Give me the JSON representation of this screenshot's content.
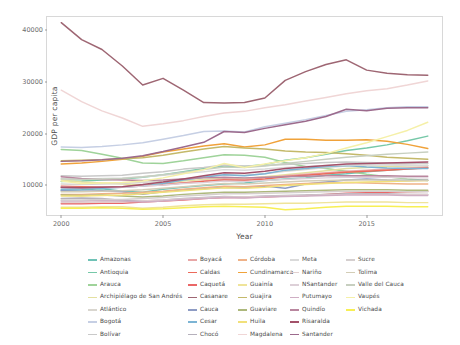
{
  "chart_data": {
    "type": "line",
    "title": "",
    "xlabel": "Year",
    "ylabel": "GDP per capita",
    "xlim": [
      1999.3,
      2018.7
    ],
    "ylim": [
      4200,
      42600
    ],
    "xticks": [
      2000,
      2005,
      2010,
      2015
    ],
    "yticks": [
      10000,
      20000,
      30000,
      40000
    ],
    "ytick_labels": [
      "10000",
      "20000",
      "30000",
      "40000"
    ],
    "xtick_labels": [
      "2000",
      "2005",
      "2010",
      "2015"
    ],
    "grid": false,
    "legend_position": "bottom",
    "legend_columns": 5,
    "x": [
      2000,
      2001,
      2002,
      2003,
      2004,
      2005,
      2006,
      2007,
      2008,
      2009,
      2010,
      2011,
      2012,
      2013,
      2014,
      2015,
      2016,
      2017,
      2018
    ],
    "series": [
      {
        "name": "Amazonas",
        "color": "#6fc2b6",
        "values": [
          9000,
          9100,
          9300,
          8800,
          8600,
          9200,
          9600,
          9900,
          10200,
          10400,
          10900,
          11200,
          11400,
          11900,
          12200,
          12600,
          12900,
          13100,
          13400
        ]
      },
      {
        "name": "Antioquia",
        "color": "#76c8a8",
        "values": [
          10700,
          10800,
          11000,
          11200,
          11500,
          12000,
          12600,
          13200,
          13700,
          13600,
          14000,
          14800,
          15300,
          16000,
          16700,
          17200,
          17800,
          18600,
          19500
        ]
      },
      {
        "name": "Arauca",
        "color": "#9fd39a",
        "values": [
          16900,
          16700,
          16000,
          15200,
          14300,
          14200,
          14700,
          15300,
          15900,
          15800,
          15400,
          14400,
          13600,
          13200,
          12700,
          12100,
          11600,
          11200,
          10900
        ]
      },
      {
        "name": "Archipiélago de San Andrés",
        "color": "#e4e0a0",
        "values": [
          11000,
          10600,
          10400,
          10200,
          10000,
          10300,
          10800,
          11100,
          11400,
          11300,
          11600,
          12000,
          12400,
          12800,
          13200,
          13400,
          13600,
          13700,
          13800
        ]
      },
      {
        "name": "Atlántico",
        "color": "#d9d6cf",
        "values": [
          10200,
          10100,
          10200,
          10300,
          10500,
          10800,
          11200,
          11600,
          12000,
          11900,
          12200,
          12700,
          13000,
          13400,
          13700,
          13900,
          14000,
          14100,
          14300
        ]
      },
      {
        "name": "Bogotá",
        "color": "#c6cfe4",
        "values": [
          17400,
          17300,
          17500,
          17800,
          18200,
          18900,
          19600,
          20400,
          20500,
          20300,
          21300,
          22000,
          22700,
          23500,
          24300,
          24600,
          25000,
          25200,
          25200
        ]
      },
      {
        "name": "Bolívar",
        "color": "#c9c9c9",
        "values": [
          11800,
          11700,
          11800,
          11900,
          12300,
          12600,
          13100,
          13400,
          13900,
          13700,
          13800,
          14000,
          14200,
          14400,
          14500,
          14400,
          14300,
          14200,
          14200
        ]
      },
      {
        "name": "Boyacá",
        "color": "#e8a7a7",
        "values": [
          9500,
          9400,
          9500,
          9600,
          9800,
          10000,
          10400,
          10800,
          11200,
          11100,
          11400,
          11800,
          12100,
          12400,
          12700,
          12900,
          13100,
          13300,
          13500
        ]
      },
      {
        "name": "Caldas",
        "color": "#ec6a5a",
        "values": [
          9800,
          9700,
          9700,
          9700,
          9900,
          10100,
          10400,
          10700,
          11000,
          10900,
          11200,
          11600,
          11900,
          12200,
          12500,
          12700,
          12900,
          13100,
          13300
        ]
      },
      {
        "name": "Caquetá",
        "color": "#ea6767",
        "values": [
          6400,
          6400,
          6500,
          6500,
          6700,
          6900,
          7100,
          7400,
          7600,
          7600,
          7700,
          7900,
          8000,
          8200,
          8400,
          8500,
          8600,
          8700,
          8800
        ]
      },
      {
        "name": "Casanare",
        "color": "#9e6673",
        "values": [
          41500,
          38200,
          36300,
          33100,
          29400,
          30700,
          28400,
          26000,
          25900,
          26000,
          26900,
          30300,
          32000,
          33400,
          34300,
          32300,
          31700,
          31400,
          31300
        ]
      },
      {
        "name": "Cauca",
        "color": "#8e9cc4",
        "values": [
          8900,
          8800,
          8900,
          8700,
          8200,
          8700,
          9100,
          9300,
          9600,
          9500,
          9800,
          9400,
          10200,
          10600,
          11000,
          11200,
          11000,
          10900,
          11000
        ]
      },
      {
        "name": "Cesar",
        "color": "#7cb4d4",
        "values": [
          9200,
          9300,
          9400,
          9600,
          9800,
          10300,
          11000,
          11500,
          12000,
          11800,
          12200,
          12900,
          13200,
          13600,
          13800,
          13500,
          13300,
          13200,
          13200
        ]
      },
      {
        "name": "Chocó",
        "color": "#b5b0bb",
        "values": [
          7400,
          7500,
          7400,
          7000,
          6900,
          7100,
          7400,
          7600,
          7800,
          7700,
          7900,
          8000,
          8100,
          8200,
          8300,
          8300,
          8300,
          8200,
          8200
        ]
      },
      {
        "name": "Córdoba",
        "color": "#efb288",
        "values": [
          8200,
          8200,
          8300,
          8400,
          8600,
          8800,
          9200,
          9500,
          9800,
          9700,
          9900,
          10100,
          10300,
          10400,
          10500,
          10400,
          10300,
          10200,
          10200
        ]
      },
      {
        "name": "Cundinamarca",
        "color": "#f0a23a",
        "values": [
          14100,
          14300,
          14600,
          15000,
          15600,
          16400,
          17000,
          17600,
          18000,
          17400,
          17800,
          18900,
          18900,
          18700,
          18700,
          18800,
          18500,
          17900,
          17100
        ]
      },
      {
        "name": "Guainía",
        "color": "#efe49a",
        "values": [
          5700,
          5700,
          5800,
          5800,
          5500,
          5700,
          6000,
          6200,
          6300,
          6300,
          6400,
          6500,
          6500,
          6600,
          6700,
          6700,
          6700,
          6600,
          6600
        ]
      },
      {
        "name": "Guajira",
        "color": "#c4b96a",
        "values": [
          14700,
          14800,
          14900,
          15100,
          15300,
          15800,
          16400,
          17000,
          17500,
          17200,
          17000,
          16600,
          16400,
          16300,
          16100,
          15800,
          15400,
          15200,
          15000
        ]
      },
      {
        "name": "Guaviare",
        "color": "#adb87c",
        "values": [
          8100,
          8000,
          8100,
          7900,
          7700,
          7900,
          8200,
          8400,
          8600,
          8600,
          8700,
          8800,
          8900,
          9000,
          9100,
          9100,
          9100,
          9000,
          9000
        ]
      },
      {
        "name": "Huila",
        "color": "#f1e07a",
        "values": [
          7900,
          7900,
          8000,
          8100,
          8300,
          8600,
          8900,
          9200,
          9500,
          9400,
          9600,
          9900,
          10100,
          10300,
          10500,
          10600,
          10700,
          10800,
          10900
        ]
      },
      {
        "name": "Magdalena",
        "color": "#f0d6d6",
        "values": [
          28400,
          26200,
          24400,
          23000,
          21400,
          21900,
          22500,
          23300,
          24000,
          24300,
          25000,
          25600,
          26300,
          27000,
          27700,
          28300,
          28700,
          29400,
          30200
        ]
      },
      {
        "name": "Meta",
        "color": "#dadada",
        "values": [
          11300,
          11200,
          11300,
          11400,
          11600,
          11900,
          12300,
          12600,
          13000,
          12900,
          13100,
          13400,
          13600,
          13800,
          13900,
          13900,
          13900,
          13800,
          13800
        ]
      },
      {
        "name": "Nariño",
        "color": "#e2d0d0",
        "values": [
          6600,
          6600,
          6700,
          6700,
          6900,
          7100,
          7300,
          7500,
          7700,
          7700,
          7800,
          7900,
          8000,
          8100,
          8200,
          8200,
          8200,
          8200,
          8200
        ]
      },
      {
        "name": "NSantander",
        "color": "#ddd0d8",
        "values": [
          9600,
          9500,
          9600,
          9600,
          9800,
          10000,
          10300,
          10500,
          10800,
          10700,
          10900,
          11100,
          11300,
          11400,
          11500,
          11500,
          11500,
          11400,
          11400
        ]
      },
      {
        "name": "Putumayo",
        "color": "#cfaec4",
        "values": [
          6900,
          6900,
          7000,
          6900,
          6700,
          6900,
          7200,
          7400,
          7600,
          7500,
          7700,
          7800,
          7900,
          8000,
          8100,
          8100,
          8100,
          8000,
          8000
        ]
      },
      {
        "name": "Quindío",
        "color": "#b9879f",
        "values": [
          11600,
          11300,
          11100,
          11000,
          10900,
          11000,
          11200,
          11400,
          11500,
          11400,
          11500,
          11600,
          11700,
          11800,
          11800,
          11800,
          11800,
          11700,
          11700
        ]
      },
      {
        "name": "Risaralda",
        "color": "#a3516a",
        "values": [
          9600,
          9500,
          9600,
          9700,
          10100,
          10600,
          11200,
          11800,
          12400,
          12300,
          12700,
          13200,
          13500,
          13800,
          14100,
          14200,
          14300,
          14400,
          14500
        ]
      },
      {
        "name": "Santander",
        "color": "#9c6a8c",
        "values": [
          14600,
          14700,
          14900,
          15200,
          15700,
          16500,
          17400,
          18300,
          20400,
          20200,
          21000,
          21700,
          22400,
          23300,
          24700,
          24400,
          24900,
          25000,
          25000
        ]
      },
      {
        "name": "Sucre",
        "color": "#d5cfcf",
        "values": [
          7100,
          7100,
          7200,
          7200,
          7400,
          7600,
          7900,
          8100,
          8300,
          8300,
          8400,
          8500,
          8600,
          8700,
          8800,
          8800,
          8800,
          8700,
          8700
        ]
      },
      {
        "name": "Tolima",
        "color": "#d3cdb6",
        "values": [
          8700,
          8700,
          8800,
          8900,
          9100,
          9400,
          9700,
          10000,
          10300,
          10200,
          10400,
          10600,
          10800,
          10900,
          11000,
          11000,
          11000,
          10900,
          10900
        ]
      },
      {
        "name": "Valle del Cauca",
        "color": "#c7cfc0",
        "values": [
          11200,
          11100,
          11200,
          11300,
          11600,
          12000,
          12500,
          13000,
          13500,
          13400,
          13700,
          14200,
          14600,
          15000,
          15400,
          15700,
          16000,
          16200,
          16400
        ]
      },
      {
        "name": "Vaupés",
        "color": "#f5f0a8",
        "values": [
          10800,
          10300,
          10400,
          10500,
          10800,
          11400,
          12200,
          13000,
          14200,
          13400,
          14100,
          14700,
          15300,
          16100,
          17200,
          18200,
          19400,
          20600,
          22200
        ]
      },
      {
        "name": "Vichada",
        "color": "#f7ef55",
        "values": [
          5500,
          5500,
          5600,
          5500,
          5300,
          5400,
          5600,
          5800,
          5900,
          5800,
          5700,
          5200,
          5400,
          5700,
          5900,
          5900,
          5900,
          5800,
          5800
        ]
      }
    ]
  },
  "axes": {
    "y_title": "GDP per capita",
    "x_title": "Year"
  },
  "legend": {
    "columns": [
      {
        "items": [
          {
            "label": "Amazonas",
            "color": "#6fc2b6"
          },
          {
            "label": "Antioquia",
            "color": "#76c8a8"
          },
          {
            "label": "Arauca",
            "color": "#9fd39a"
          },
          {
            "label": "Archipiélago de San Andrés",
            "color": "#e4e0a0"
          },
          {
            "label": "Atlántico",
            "color": "#d9d6cf"
          },
          {
            "label": "Bogotá",
            "color": "#c6cfe4"
          },
          {
            "label": "Bolívar",
            "color": "#c9c9c9"
          }
        ]
      },
      {
        "items": [
          {
            "label": "Boyacá",
            "color": "#e8a7a7"
          },
          {
            "label": "Caldas",
            "color": "#ec6a5a"
          },
          {
            "label": "Caquetá",
            "color": "#ea6767"
          },
          {
            "label": "Casanare",
            "color": "#9e6673"
          },
          {
            "label": "Cauca",
            "color": "#8e9cc4"
          },
          {
            "label": "Cesar",
            "color": "#7cb4d4"
          },
          {
            "label": "Chocó",
            "color": "#b5b0bb"
          }
        ]
      },
      {
        "items": [
          {
            "label": "Córdoba",
            "color": "#efb288"
          },
          {
            "label": "Cundinamarca",
            "color": "#f0a23a"
          },
          {
            "label": "Guainía",
            "color": "#efe49a"
          },
          {
            "label": "Guajira",
            "color": "#c4b96a"
          },
          {
            "label": "Guaviare",
            "color": "#adb87c"
          },
          {
            "label": "Huila",
            "color": "#f1e07a"
          },
          {
            "label": "Magdalena",
            "color": "#f0d6d6"
          }
        ]
      },
      {
        "items": [
          {
            "label": "Meta",
            "color": "#dadada"
          },
          {
            "label": "Nariño",
            "color": "#e2d0d0"
          },
          {
            "label": "NSantander",
            "color": "#ddd0d8"
          },
          {
            "label": "Putumayo",
            "color": "#cfaec4"
          },
          {
            "label": "Quindío",
            "color": "#b9879f"
          },
          {
            "label": "Risaralda",
            "color": "#a3516a"
          },
          {
            "label": "Santander",
            "color": "#9c6a8c"
          }
        ]
      },
      {
        "items": [
          {
            "label": "Sucre",
            "color": "#d5cfcf"
          },
          {
            "label": "Tolima",
            "color": "#d3cdb6"
          },
          {
            "label": "Valle del Cauca",
            "color": "#c7cfc0"
          },
          {
            "label": "Vaupés",
            "color": "#f5f0a8"
          },
          {
            "label": "Vichada",
            "color": "#f7ef55"
          }
        ]
      }
    ]
  }
}
